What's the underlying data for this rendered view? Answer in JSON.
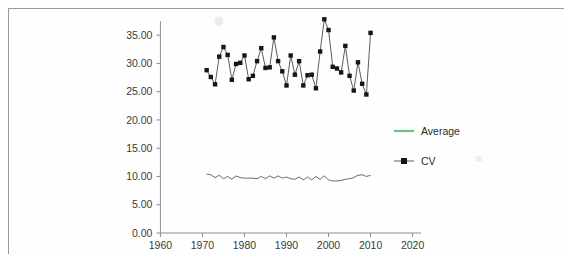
{
  "figure": {
    "frame_color": "#9a9a9a",
    "background": "#fefefe"
  },
  "axes": {
    "y_tick_labels": [
      "35.00",
      "30.00",
      "25.00",
      "20.00",
      "15.00",
      "10.00",
      "5.00",
      "0.00"
    ],
    "x_tick_labels": [
      "1960",
      "1970",
      "1980",
      "1990",
      "2000",
      "2010",
      "2020"
    ]
  },
  "legend": {
    "position": "right-middle",
    "entries": [
      {
        "label": "Average",
        "color": "#6fbf7f",
        "marker": "none",
        "icon": "line-swatch-icon"
      },
      {
        "label": "CV",
        "color": "#161616",
        "marker": "square",
        "icon": "line-marker-swatch-icon"
      }
    ]
  },
  "chart_data": {
    "type": "line",
    "title": "",
    "xlabel": "",
    "ylabel": "",
    "xlim": [
      1958,
      2022
    ],
    "ylim": [
      0.0,
      37.5
    ],
    "y_ticks": [
      0.0,
      5.0,
      10.0,
      15.0,
      20.0,
      25.0,
      30.0,
      35.0
    ],
    "x_ticks": [
      1960,
      1970,
      1980,
      1990,
      2000,
      2010,
      2020
    ],
    "grid": false,
    "legend_position": "right",
    "x": [
      1971,
      1972,
      1973,
      1974,
      1975,
      1976,
      1977,
      1978,
      1979,
      1980,
      1981,
      1982,
      1983,
      1984,
      1985,
      1986,
      1987,
      1988,
      1989,
      1990,
      1991,
      1992,
      1993,
      1994,
      1995,
      1996,
      1997,
      1998,
      1999,
      2000,
      2001,
      2002,
      2003,
      2004,
      2005,
      2006,
      2007,
      2008,
      2009,
      2010
    ],
    "series": [
      {
        "name": "CV",
        "color": "#161616",
        "marker": "square",
        "values": [
          28.8,
          27.6,
          26.3,
          31.2,
          32.9,
          31.5,
          27.1,
          29.9,
          30.1,
          31.4,
          27.2,
          27.8,
          30.4,
          32.7,
          29.2,
          29.3,
          34.6,
          30.4,
          28.6,
          26.1,
          31.4,
          28.0,
          30.4,
          26.1,
          27.9,
          28.0,
          25.6,
          32.1,
          37.8,
          35.9,
          29.4,
          29.1,
          28.4,
          33.1,
          27.8,
          25.2,
          30.2,
          26.4,
          24.5,
          35.4
        ]
      },
      {
        "name": "Average",
        "color": "#6fbf7f",
        "marker": "none",
        "values": [
          10.4,
          10.3,
          9.8,
          10.2,
          9.6,
          10.0,
          9.5,
          10.1,
          9.8,
          9.7,
          9.7,
          9.7,
          9.6,
          10.0,
          9.6,
          10.1,
          9.7,
          10.1,
          9.7,
          9.9,
          9.6,
          9.5,
          9.9,
          9.4,
          9.9,
          9.4,
          10.0,
          9.5,
          10.1,
          9.4,
          9.2,
          9.2,
          9.3,
          9.5,
          9.6,
          9.8,
          10.2,
          10.3,
          10.0,
          10.2
        ]
      }
    ]
  }
}
